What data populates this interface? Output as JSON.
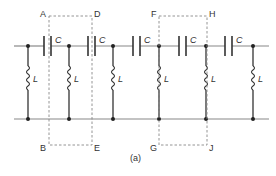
{
  "figure": {
    "caption": "(a)",
    "colors": {
      "wire": "#888888",
      "component": "#333333",
      "dashed": "#888888",
      "text": "#333333"
    }
  },
  "components": {
    "capacitor_label": "C",
    "inductor_label": "L",
    "capacitor_count": 5,
    "inductor_count": 6
  },
  "boxes": [
    {
      "id": "box-1",
      "corners": {
        "top_left": "A",
        "top_right": "D",
        "bottom_left": "B",
        "bottom_right": "E"
      }
    },
    {
      "id": "box-2",
      "corners": {
        "top_left": "F",
        "top_right": "H",
        "bottom_left": "G",
        "bottom_right": "J"
      }
    }
  ]
}
